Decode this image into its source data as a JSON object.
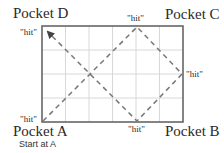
{
  "pockets": {
    "a": "Pocket A",
    "b": "Pocket B",
    "c": "Pocket C",
    "d": "Pocket D"
  },
  "start_note": "Start at A",
  "hits": {
    "top": "\"hit\"",
    "right": "\"hit\"",
    "bottom": "\"hit\"",
    "bottom_left": "\"hit\"",
    "top_left": "\"hit\""
  },
  "table": {
    "grid_columns": 6,
    "grid_rows": 4,
    "border_color": "#666666",
    "grid_color": "#d8d8d8",
    "path_color": "#777777"
  },
  "path": {
    "sequence": [
      "Pocket A",
      "top hit",
      "right hit",
      "bottom hit",
      "Pocket D"
    ],
    "style": "dashed",
    "ends_with_arrow": true
  }
}
